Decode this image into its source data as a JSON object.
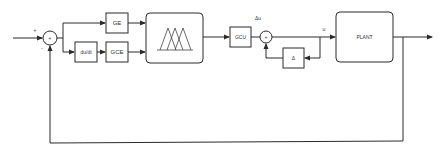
{
  "diagram": {
    "type": "fuzzy-control-block-diagram",
    "stroke_color": "#2b2b2b",
    "background": "#ffffff",
    "junction1": {
      "plus_sign": "+",
      "minus_sign": "-",
      "center_sign": "+"
    },
    "junction2": {
      "center_sign": "+"
    },
    "blocks": {
      "ge": "GE",
      "dudt": "du/dt",
      "gce": "GCE",
      "fuzzy": "",
      "gcu": "GCU",
      "delta": "Δ",
      "plant": "PLANT"
    },
    "labels": {
      "delta_u": "Δu",
      "u": "u"
    }
  }
}
